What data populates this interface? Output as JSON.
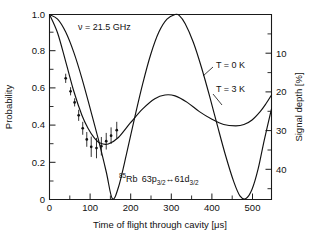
{
  "figure": {
    "background": "#ffffff",
    "ink_color": "#111111"
  },
  "axes": {
    "left": {
      "label": "Probability",
      "ticks": [
        "0",
        "0.2",
        "0.4",
        "0.6",
        "0.8",
        "1.0"
      ],
      "tick_values": [
        0,
        0.2,
        0.4,
        0.6,
        0.8,
        1.0
      ],
      "range": [
        0,
        1.0
      ],
      "minor_per_interval": 1
    },
    "right": {
      "label": "Signal depth [%]",
      "ticks": [
        "10",
        "20",
        "30",
        "40"
      ],
      "tick_values": [
        10,
        20,
        30,
        40
      ],
      "range": [
        0,
        48
      ],
      "inverted": true
    },
    "bottom": {
      "label": "Time of flight through cavity [μs]",
      "ticks": [
        "0",
        "100",
        "200",
        "300",
        "400",
        "500"
      ],
      "tick_values": [
        0,
        100,
        200,
        300,
        400,
        500
      ],
      "range": [
        0,
        548
      ],
      "minor_per_interval": 1
    }
  },
  "annotations": {
    "frequency": "ν = 21.5 GHz",
    "transition_prefix_sup": "85",
    "transition_element": "Rb",
    "transition_state1": "63p",
    "transition_sub1": "3/2",
    "transition_arrow": "↔",
    "transition_state2": "61d",
    "transition_sub2": "3/2",
    "curve_label_0k": "T = 0 K",
    "curve_label_3k": "T = 3 K"
  },
  "chart_data": {
    "type": "line",
    "title": "",
    "xlabel": "Time of flight through cavity [μs]",
    "ylabel": "Probability",
    "y2label": "Signal depth [%]",
    "xlim": [
      0,
      548
    ],
    "ylim": [
      0,
      1.0
    ],
    "y2lim": [
      0,
      48
    ],
    "y2_inverted": true,
    "grid": false,
    "legend": "inline-labels",
    "series": [
      {
        "name": "T = 0 K",
        "type": "line",
        "x": [
          0,
          20,
          40,
          60,
          80,
          100,
          120,
          140,
          155,
          170,
          190,
          210,
          230,
          250,
          270,
          290,
          310,
          320,
          335,
          355,
          375,
          395,
          415,
          435,
          455,
          470,
          485,
          500,
          515,
          530,
          548
        ],
        "y": [
          1.0,
          0.975,
          0.905,
          0.795,
          0.655,
          0.495,
          0.33,
          0.15,
          0.005,
          0.065,
          0.245,
          0.44,
          0.625,
          0.785,
          0.905,
          0.975,
          1.0,
          0.995,
          0.95,
          0.85,
          0.715,
          0.56,
          0.395,
          0.235,
          0.095,
          0.02,
          0.005,
          0.055,
          0.165,
          0.32,
          0.49
        ]
      },
      {
        "name": "T = 3 K",
        "type": "line",
        "x": [
          0,
          20,
          40,
          60,
          80,
          95,
          110,
          125,
          145,
          170,
          200,
          230,
          260,
          285,
          310,
          340,
          370,
          400,
          430,
          460,
          480,
          500,
          520,
          535,
          548
        ],
        "y": [
          1.0,
          0.9,
          0.745,
          0.585,
          0.455,
          0.385,
          0.335,
          0.305,
          0.3,
          0.335,
          0.415,
          0.49,
          0.545,
          0.565,
          0.56,
          0.525,
          0.475,
          0.435,
          0.405,
          0.398,
          0.405,
          0.43,
          0.475,
          0.52,
          0.565
        ]
      },
      {
        "name": "measured data",
        "type": "scatter-errorbar",
        "points": [
          {
            "x": 40,
            "y": 0.655,
            "yerr": 0.025
          },
          {
            "x": 52,
            "y": 0.585,
            "yerr": 0.022
          },
          {
            "x": 62,
            "y": 0.525,
            "yerr": 0.022
          },
          {
            "x": 72,
            "y": 0.455,
            "yerr": 0.03
          },
          {
            "x": 82,
            "y": 0.385,
            "yerr": 0.035
          },
          {
            "x": 92,
            "y": 0.325,
            "yerr": 0.04
          },
          {
            "x": 103,
            "y": 0.285,
            "yerr": 0.055
          },
          {
            "x": 116,
            "y": 0.278,
            "yerr": 0.055
          },
          {
            "x": 128,
            "y": 0.288,
            "yerr": 0.05
          },
          {
            "x": 140,
            "y": 0.315,
            "yerr": 0.045
          },
          {
            "x": 152,
            "y": 0.345,
            "yerr": 0.045
          },
          {
            "x": 166,
            "y": 0.375,
            "yerr": 0.045
          }
        ]
      }
    ]
  }
}
